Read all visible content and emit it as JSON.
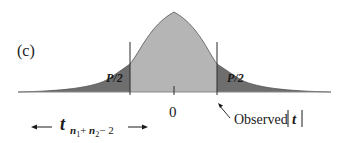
{
  "diagram": {
    "panel_label": "(c)",
    "distribution": "t distribution (two-tailed)",
    "tail_left_label": "P/2",
    "tail_right_label": "P/2",
    "center_tick_label": "0",
    "df_label": {
      "variable": "t",
      "subscript_parts": [
        "n",
        "1",
        "+ ",
        "n",
        "2",
        "− 2"
      ]
    },
    "observed_label": "Observed",
    "observed_symbol": "t",
    "colors": {
      "tail_fill": "#6e6e6e",
      "center_fill": "#b5b5b5",
      "curve_stroke": "#555555",
      "baseline": "#888888",
      "cut_line": "#2a2a2a",
      "text": "#1a1a1a"
    }
  }
}
